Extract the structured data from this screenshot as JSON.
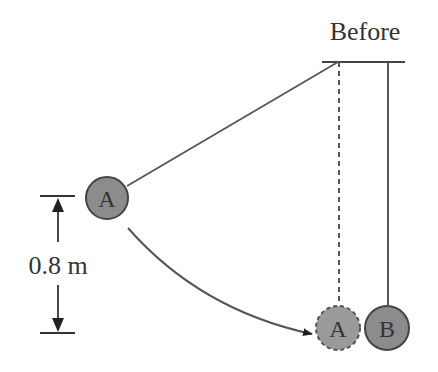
{
  "title": "Before",
  "height_label": "0.8 m",
  "balls": {
    "a_start": {
      "label": "A"
    },
    "a_end": {
      "label": "A"
    },
    "b": {
      "label": "B"
    }
  },
  "colors": {
    "ball_fill": "#8c8c8c",
    "line": "#444444",
    "text": "#333333"
  }
}
